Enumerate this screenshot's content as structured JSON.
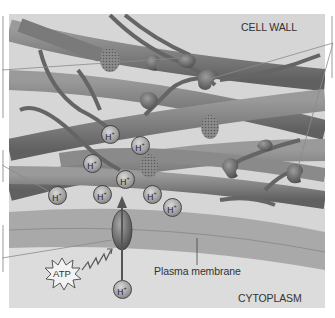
{
  "figure": {
    "labels": {
      "cell_wall": "CELL WALL",
      "plasma_membrane": "Plasma membrane",
      "cytoplasm": "CYTOPLASM",
      "atp": "ATP"
    },
    "ions": {
      "symbol": "H",
      "charge": "+",
      "items": [
        {
          "x": 110,
          "y": 134
        },
        {
          "x": 140,
          "y": 145
        },
        {
          "x": 92,
          "y": 163
        },
        {
          "x": 125,
          "y": 179
        },
        {
          "x": 57,
          "y": 195
        },
        {
          "x": 102,
          "y": 194
        },
        {
          "x": 152,
          "y": 194
        },
        {
          "x": 172,
          "y": 207
        },
        {
          "x": 122,
          "y": 289
        }
      ]
    },
    "colors": {
      "panel_bg": "#d6d6d6",
      "fiber": "#8a8a8a",
      "fiber_dark": "#5e5e5e",
      "membrane": "#a9a9a9",
      "cytoplasm_bg": "#dcdcdc",
      "leader_line": "#6a6a6a"
    }
  }
}
